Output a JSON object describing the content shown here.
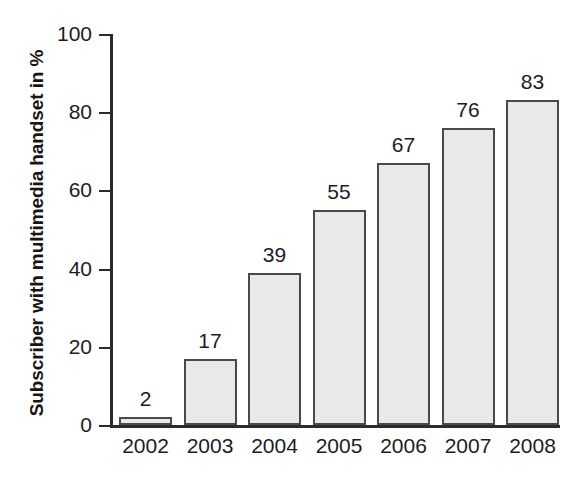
{
  "chart_data": {
    "type": "bar",
    "title": "",
    "xlabel": "",
    "ylabel": "Subscriber with multimedia handset in %",
    "categories": [
      "2002",
      "2003",
      "2004",
      "2005",
      "2006",
      "2007",
      "2008"
    ],
    "values": [
      2,
      17,
      39,
      55,
      67,
      76,
      83
    ],
    "value_labels": [
      "2",
      "17",
      "39",
      "55",
      "67",
      "76",
      "83"
    ],
    "ylim": [
      0,
      100
    ],
    "yticks": [
      0,
      20,
      40,
      60,
      80,
      100
    ],
    "ytick_labels": [
      "0",
      "20",
      "40",
      "60",
      "80",
      "100"
    ],
    "grid": false,
    "legend": null,
    "bar_fill_color": "#e9e9e9",
    "bar_border_color": "#494949",
    "axis_color": "#2b2b2b",
    "background_color": "#ffffff"
  },
  "caption": {
    "ghost_text": ""
  }
}
